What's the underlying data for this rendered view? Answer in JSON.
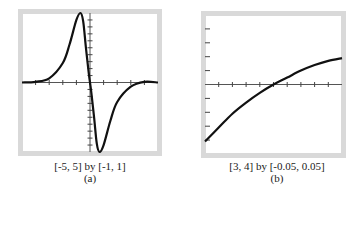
{
  "chart_data": [
    {
      "id": "a",
      "type": "line",
      "title": "",
      "caption": "[-5, 5] by [-1, 1]",
      "label": "(a)",
      "xlim": [
        -5,
        5
      ],
      "ylim": [
        -1,
        1
      ],
      "x_tick_step": 1,
      "y_tick_step": 0.1,
      "grid": false,
      "series": [
        {
          "name": "f(x)",
          "x": [
            -5,
            -4,
            -3,
            -2,
            -1.5,
            -1,
            -0.7,
            -0.5,
            -0.3,
            -0.1,
            0,
            0.1,
            0.3,
            0.5,
            0.7,
            1,
            1.5,
            2,
            3,
            4,
            5
          ],
          "y": [
            0,
            0.01,
            0.06,
            0.28,
            0.55,
            0.9,
            1.0,
            0.88,
            0.5,
            0.15,
            0,
            -0.15,
            -0.5,
            -0.88,
            -1.0,
            -0.9,
            -0.55,
            -0.28,
            -0.06,
            0.01,
            0
          ]
        }
      ]
    },
    {
      "id": "b",
      "type": "line",
      "title": "",
      "caption": "[3, 4] by [-0.05, 0.05]",
      "label": "(b)",
      "xlim": [
        3,
        4
      ],
      "ylim": [
        -0.05,
        0.05
      ],
      "x_tick_step": 0.1,
      "y_tick_step": 0.01,
      "grid": false,
      "series": [
        {
          "name": "f(x)",
          "x": [
            3.0,
            3.1,
            3.2,
            3.3,
            3.4,
            3.5,
            3.6,
            3.7,
            3.8,
            3.9,
            4.0
          ],
          "y": [
            -0.041,
            -0.031,
            -0.021,
            -0.013,
            -0.006,
            0.0,
            0.005,
            0.01,
            0.014,
            0.017,
            0.019
          ]
        }
      ]
    }
  ]
}
